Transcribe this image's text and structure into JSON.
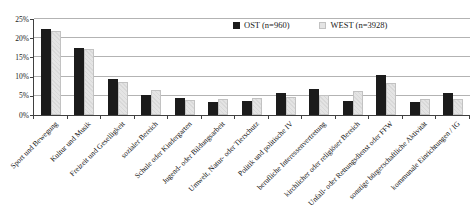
{
  "chart_data": {
    "type": "bar",
    "title": "",
    "categories": [
      "Sport und Bewegung",
      "Kultur und Musik",
      "Freizeit und Geselligkeit",
      "sozialer Bereich",
      "Schule oder Kindergarten",
      "Jugend- oder Bildungsarbeit",
      "Umwelt, Natur- oder Tierschutz",
      "Politik und politische IV",
      "berufliche Interessenvertretung",
      "kirchlicher oder religiöser Bereich",
      "Unfall- oder Rettungsdienst oder FFW",
      "sonstige bürgerschaftliche Aktivität",
      "kommunale Einrichtungen / IG"
    ],
    "series": [
      {
        "name": "OST (n=960)",
        "color": "#1b1b1b",
        "values": [
          22.3,
          17.5,
          9.3,
          5.3,
          4.4,
          3.3,
          3.6,
          5.7,
          6.7,
          3.7,
          10.5,
          3.3,
          5.7
        ]
      },
      {
        "name": "WEST (n=3928)",
        "color": "#e4e4e4",
        "values": [
          22.0,
          17.1,
          8.5,
          6.4,
          3.9,
          4.1,
          4.4,
          4.7,
          5.2,
          6.3,
          8.3,
          4.1,
          4.1
        ]
      }
    ],
    "ylabel": "",
    "xlabel": "",
    "ylim": [
      0,
      25
    ],
    "ytick_step": 5,
    "ytick_labels": [
      "0%",
      "5%",
      "10%",
      "15%",
      "20%",
      "25%"
    ],
    "grid": true,
    "legend_position": "top-center"
  },
  "colors": {
    "grid": "#b3b3b3",
    "axis": "#404040",
    "text": "#1a1a1a"
  }
}
